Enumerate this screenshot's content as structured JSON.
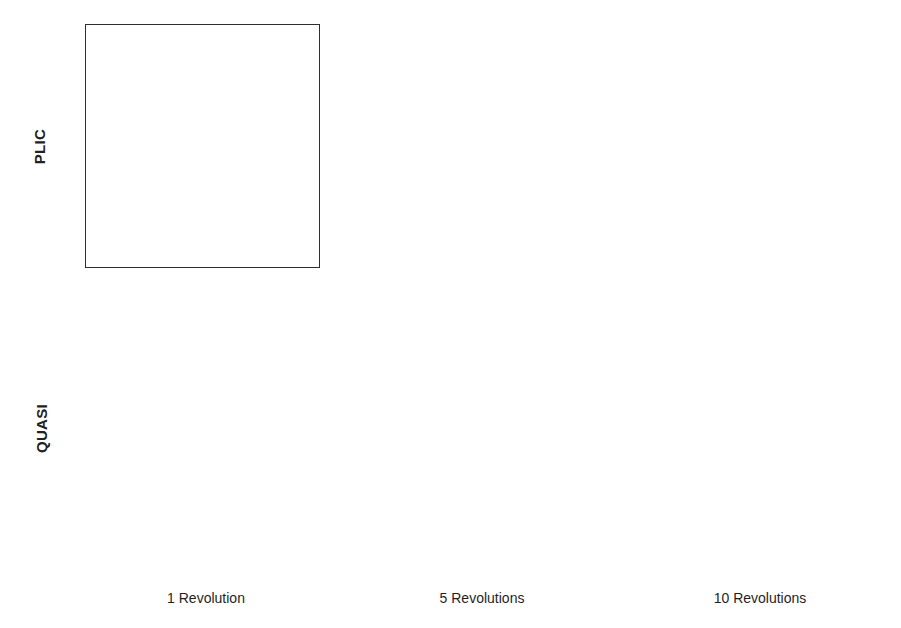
{
  "figure": {
    "background": "#ffffff",
    "line_color": "#2e2e2e"
  },
  "row_labels": [
    {
      "id": "plic",
      "text": "PLIC"
    },
    {
      "id": "quasi",
      "text": "QUASI"
    }
  ],
  "column_captions": [
    {
      "id": "rev1",
      "text": "1 Revolution"
    },
    {
      "id": "rev5",
      "text": "5 Revolutions"
    },
    {
      "id": "rev10",
      "text": "10 Revolutions"
    }
  ],
  "axes": {
    "xlabel": "",
    "ylabel": "",
    "xlim": [
      1.0,
      3.0
    ],
    "ylim": [
      1.5,
      3.5
    ],
    "xticks": [
      "1.0",
      "1.5",
      "2.0",
      "2.5",
      "3.0"
    ],
    "yticks": [
      "1.5",
      "2.0",
      "2.5",
      "3.0",
      "3.5"
    ],
    "xtick_values": [
      1.0,
      1.5,
      2.0,
      2.5,
      3.0
    ],
    "ytick_values": [
      1.5,
      2.0,
      2.5,
      3.0,
      3.5
    ],
    "grid": false
  },
  "chart_data": {
    "type": "line",
    "xlabel": "",
    "ylabel": "",
    "xlim": [
      1.0,
      3.0
    ],
    "ylim": [
      1.5,
      3.5
    ],
    "xticks": [
      1.0,
      1.5,
      2.0,
      2.5,
      3.0
    ],
    "yticks": [
      1.5,
      2.0,
      2.5,
      3.0,
      3.5
    ],
    "grid": false,
    "legend": "none",
    "rows": [
      "PLIC",
      "QUASI"
    ],
    "columns": [
      "1 Revolution",
      "5 Revolutions",
      "10 Revolutions"
    ],
    "panels": [
      {
        "row": "PLIC",
        "column": "1 Revolution",
        "center": [
          2.0,
          2.655
        ],
        "radius": 0.48,
        "slot_width": 0.115,
        "slot_top": 2.74,
        "distortion": "slight rounding at slot corners",
        "series": [
          {
            "name": "interface-contour",
            "closed": true
          }
        ]
      },
      {
        "row": "PLIC",
        "column": "5 Revolutions",
        "center": [
          2.0,
          2.655
        ],
        "radius": 0.48,
        "slot_width": 0.16,
        "slot_top": 2.72,
        "distortion": "slot widened and tilted, lower-left shoulder flattened",
        "series": [
          {
            "name": "interface-contour",
            "closed": true
          }
        ]
      },
      {
        "row": "PLIC",
        "column": "10 Revolutions",
        "center": [
          2.0,
          2.655
        ],
        "radius": 0.48,
        "slot_width": 0.2,
        "slot_top": 2.66,
        "distortion": "slot strongly curved into a hook, left shoulder dimpled",
        "series": [
          {
            "name": "interface-contour",
            "closed": true
          }
        ]
      },
      {
        "row": "QUASI",
        "column": "1 Revolution",
        "center": [
          2.0,
          2.655
        ],
        "radius": 0.48,
        "slot_width": 0.095,
        "slot_top": 2.74,
        "distortion": "negligible, slot edges remain straight",
        "series": [
          {
            "name": "interface-contour",
            "closed": true
          }
        ]
      },
      {
        "row": "QUASI",
        "column": "5 Revolutions",
        "center": [
          2.0,
          2.655
        ],
        "radius": 0.48,
        "slot_width": 0.1,
        "slot_top": 2.74,
        "distortion": "very small, slight waviness near slot base",
        "series": [
          {
            "name": "interface-contour",
            "closed": true
          }
        ]
      },
      {
        "row": "QUASI",
        "column": "10 Revolutions",
        "center": [
          2.0,
          2.655
        ],
        "radius": 0.48,
        "slot_width": 0.105,
        "slot_top": 2.74,
        "distortion": "small, slot preserved with minor rounding at the mouth",
        "series": [
          {
            "name": "interface-contour",
            "closed": true
          }
        ]
      }
    ]
  }
}
